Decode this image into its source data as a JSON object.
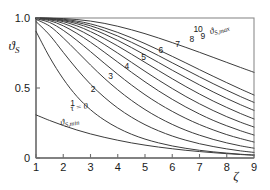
{
  "chart_data": {
    "type": "line",
    "title": "",
    "xlabel": "ζ",
    "ylabel": "ϑ",
    "ylabel_sub": "S",
    "xlim": [
      1,
      9
    ],
    "ylim": [
      0,
      1
    ],
    "grid": false,
    "legend": "inline-curve-labels",
    "xticks": [
      "1",
      "2",
      "3",
      "4",
      "5",
      "6",
      "7",
      "8",
      "9"
    ],
    "xtick_values": [
      1,
      2,
      3,
      4,
      5,
      6,
      7,
      8,
      9
    ],
    "yticks": [
      "0",
      "0.5",
      "1.0"
    ],
    "ytick_values": [
      0,
      0.5,
      1.0
    ],
    "annotations": [
      {
        "text": "τ = 0",
        "x": 2.6,
        "y": 0.345,
        "rotation": -9
      },
      {
        "text": "ϑ",
        "sub": "S,min",
        "x": 2.25,
        "y": 0.245,
        "rotation": -9
      },
      {
        "text": "ϑ",
        "sub": "S,max",
        "x": 7.75,
        "y": 0.905,
        "rotation": -17
      }
    ],
    "curve_label_name": "τ",
    "series": [
      {
        "name": "τ = 0",
        "label": "",
        "label_x": 0,
        "label_y": 0,
        "x": [
          1,
          1.5,
          2,
          2.5,
          3,
          3.5,
          4,
          4.5,
          5,
          5.5,
          6,
          6.5,
          7,
          7.5,
          8,
          8.5,
          9
        ],
        "y": [
          0.308,
          0.268,
          0.232,
          0.2,
          0.172,
          0.148,
          0.127,
          0.108,
          0.092,
          0.078,
          0.066,
          0.055,
          0.046,
          0.038,
          0.031,
          0.025,
          0.02
        ]
      },
      {
        "name": "τ = 1",
        "label": "1",
        "label_x": 2.34,
        "label_y": 0.372,
        "x": [
          1,
          1.5,
          2,
          2.5,
          3,
          3.5,
          4,
          4.5,
          5,
          5.5,
          6,
          6.5,
          7,
          7.5,
          8,
          8.5,
          9
        ],
        "y": [
          0.905,
          0.72,
          0.565,
          0.44,
          0.345,
          0.272,
          0.215,
          0.17,
          0.135,
          0.108,
          0.086,
          0.069,
          0.055,
          0.044,
          0.035,
          0.027,
          0.021
        ]
      },
      {
        "name": "τ = 2",
        "label": "2",
        "label_x": 3.1,
        "label_y": 0.475,
        "x": [
          1,
          1.5,
          2,
          2.5,
          3,
          3.5,
          4,
          4.5,
          5,
          5.5,
          6,
          6.5,
          7,
          7.5,
          8,
          8.5,
          9
        ],
        "y": [
          0.975,
          0.878,
          0.755,
          0.635,
          0.527,
          0.435,
          0.357,
          0.292,
          0.238,
          0.194,
          0.157,
          0.127,
          0.102,
          0.082,
          0.065,
          0.051,
          0.04
        ]
      },
      {
        "name": "τ = 3",
        "label": "3",
        "label_x": 3.74,
        "label_y": 0.562,
        "x": [
          1,
          1.5,
          2,
          2.5,
          3,
          3.5,
          4,
          4.5,
          5,
          5.5,
          6,
          6.5,
          7,
          7.5,
          8,
          8.5,
          9
        ],
        "y": [
          0.99,
          0.942,
          0.858,
          0.762,
          0.664,
          0.571,
          0.487,
          0.412,
          0.346,
          0.289,
          0.24,
          0.198,
          0.163,
          0.133,
          0.108,
          0.087,
          0.07
        ]
      },
      {
        "name": "τ = 4",
        "label": "4",
        "label_x": 4.33,
        "label_y": 0.636,
        "x": [
          1,
          1.5,
          2,
          2.5,
          3,
          3.5,
          4,
          4.5,
          5,
          5.5,
          6,
          6.5,
          7,
          7.5,
          8,
          8.5,
          9
        ],
        "y": [
          0.995,
          0.968,
          0.912,
          0.84,
          0.76,
          0.678,
          0.598,
          0.522,
          0.452,
          0.389,
          0.333,
          0.283,
          0.239,
          0.201,
          0.167,
          0.139,
          0.114
        ]
      },
      {
        "name": "τ = 5",
        "label": "5",
        "label_x": 4.95,
        "label_y": 0.7,
        "x": [
          1,
          1.5,
          2,
          2.5,
          3,
          3.5,
          4,
          4.5,
          5,
          5.5,
          6,
          6.5,
          7,
          7.5,
          8,
          8.5,
          9
        ],
        "y": [
          0.997,
          0.981,
          0.944,
          0.89,
          0.827,
          0.757,
          0.685,
          0.613,
          0.544,
          0.479,
          0.419,
          0.364,
          0.314,
          0.269,
          0.23,
          0.195,
          0.164
        ]
      },
      {
        "name": "τ = 6",
        "label": "6",
        "label_x": 5.58,
        "label_y": 0.752,
        "x": [
          1,
          1.5,
          2,
          2.5,
          3,
          3.5,
          4,
          4.5,
          5,
          5.5,
          6,
          6.5,
          7,
          7.5,
          8,
          8.5,
          9
        ],
        "y": [
          0.998,
          0.988,
          0.962,
          0.922,
          0.871,
          0.812,
          0.749,
          0.684,
          0.619,
          0.556,
          0.496,
          0.439,
          0.387,
          0.339,
          0.295,
          0.256,
          0.221
        ]
      },
      {
        "name": "τ = 7",
        "label": "7",
        "label_x": 6.2,
        "label_y": 0.793,
        "x": [
          1,
          1.5,
          2,
          2.5,
          3,
          3.5,
          4,
          4.5,
          5,
          5.5,
          6,
          6.5,
          7,
          7.5,
          8,
          8.5,
          9
        ],
        "y": [
          0.999,
          0.992,
          0.974,
          0.944,
          0.903,
          0.854,
          0.8,
          0.742,
          0.683,
          0.624,
          0.566,
          0.51,
          0.457,
          0.407,
          0.361,
          0.318,
          0.279
        ]
      },
      {
        "name": "τ = 8",
        "label": "8",
        "label_x": 6.72,
        "label_y": 0.826,
        "x": [
          1,
          1.5,
          2,
          2.5,
          3,
          3.5,
          4,
          4.5,
          5,
          5.5,
          6,
          6.5,
          7,
          7.5,
          8,
          8.5,
          9
        ],
        "y": [
          0.999,
          0.994,
          0.981,
          0.959,
          0.927,
          0.886,
          0.84,
          0.789,
          0.736,
          0.682,
          0.627,
          0.574,
          0.522,
          0.472,
          0.425,
          0.381,
          0.34
        ]
      },
      {
        "name": "τ = 9",
        "label": "9",
        "label_x": 7.12,
        "label_y": 0.85,
        "x": [
          1,
          1.5,
          2,
          2.5,
          3,
          3.5,
          4,
          4.5,
          5,
          5.5,
          6,
          6.5,
          7,
          7.5,
          8,
          8.5,
          9
        ],
        "y": [
          0.999,
          0.996,
          0.986,
          0.969,
          0.944,
          0.91,
          0.871,
          0.827,
          0.78,
          0.731,
          0.68,
          0.63,
          0.58,
          0.531,
          0.484,
          0.439,
          0.397
        ]
      },
      {
        "name": "τ = 10",
        "label": "10",
        "label_x": 6.95,
        "label_y": 0.898,
        "x": [
          1,
          1.5,
          2,
          2.5,
          3,
          3.5,
          4,
          4.5,
          5,
          5.5,
          6,
          6.5,
          7,
          7.5,
          8,
          8.5,
          9
        ],
        "y": [
          1.0,
          0.998,
          0.991,
          0.978,
          0.958,
          0.93,
          0.897,
          0.859,
          0.817,
          0.772,
          0.726,
          0.679,
          0.631,
          0.584,
          0.538,
          0.493,
          0.45
        ]
      },
      {
        "name": "ϑ S,max envelope",
        "label": "",
        "label_x": 0,
        "label_y": 0,
        "x": [
          1,
          1.5,
          2,
          2.5,
          3,
          3.5,
          4,
          4.5,
          5,
          5.5,
          6,
          6.5,
          7,
          7.5,
          8,
          8.5,
          9
        ],
        "y": [
          1.0,
          0.999,
          0.996,
          0.989,
          0.978,
          0.962,
          0.941,
          0.916,
          0.888,
          0.857,
          0.824,
          0.79,
          0.755,
          0.719,
          0.683,
          0.647,
          0.612
        ]
      }
    ]
  },
  "style": {
    "curve_color": "#3c3c3c",
    "frame_color": "#8c8c8c",
    "axis_color": "#6e6e6e",
    "text_color": "#1a1a1a",
    "background": "#ffffff"
  }
}
